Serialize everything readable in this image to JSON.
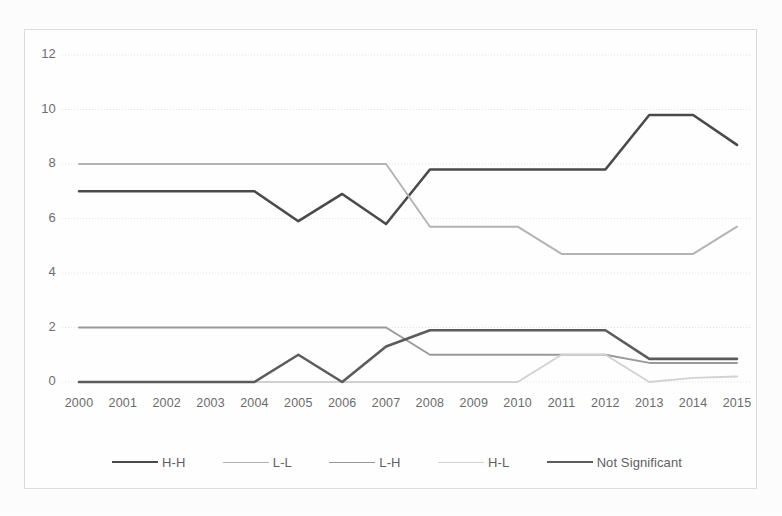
{
  "chart_data": {
    "type": "line",
    "title": "",
    "xlabel": "",
    "ylabel": "",
    "categories": [
      "2000",
      "2001",
      "2002",
      "2003",
      "2004",
      "2005",
      "2006",
      "2007",
      "2008",
      "2009",
      "2010",
      "2011",
      "2012",
      "2013",
      "2014",
      "2015"
    ],
    "ylim": [
      0,
      12
    ],
    "yticks": [
      0,
      2,
      4,
      6,
      8,
      10,
      12
    ],
    "ytick_labels": [
      "0",
      "2",
      "4",
      "6",
      "8",
      "10",
      "12"
    ],
    "grid": true,
    "legend_position": "bottom",
    "series": [
      {
        "name": "H-H",
        "color": "#4a4a4a",
        "width": 2.6,
        "values": [
          7,
          7,
          7,
          7,
          7,
          5.9,
          6.9,
          5.8,
          7.8,
          7.8,
          7.8,
          7.8,
          7.8,
          9.8,
          9.8,
          8.7
        ]
      },
      {
        "name": "L-L",
        "color": "#b4b4b4",
        "width": 1.9,
        "values": [
          8,
          8,
          8,
          8,
          8,
          8,
          8,
          8,
          5.7,
          5.7,
          5.7,
          4.7,
          4.7,
          4.7,
          4.7,
          5.7
        ]
      },
      {
        "name": "L-H",
        "color": "#9a9a9a",
        "width": 1.9,
        "values": [
          2,
          2,
          2,
          2,
          2,
          2,
          2,
          2,
          1,
          1,
          1,
          1,
          1,
          0.7,
          0.7,
          0.7
        ]
      },
      {
        "name": "H-L",
        "color": "#d2d2d2",
        "width": 1.9,
        "values": [
          0,
          0,
          0,
          0,
          0,
          0,
          0,
          0,
          0,
          0,
          0,
          1,
          1,
          0,
          0.15,
          0.2
        ]
      },
      {
        "name": "Not Significant",
        "color": "#5c5c5c",
        "width": 2.6,
        "values": [
          0,
          0,
          0,
          0,
          0,
          1,
          0,
          1.3,
          1.9,
          1.9,
          1.9,
          1.9,
          1.9,
          0.85,
          0.85,
          0.85
        ]
      }
    ]
  },
  "legend": {
    "items": [
      {
        "label": "H-H"
      },
      {
        "label": "L-L"
      },
      {
        "label": "L-H"
      },
      {
        "label": "H-L"
      },
      {
        "label": "Not Significant"
      }
    ]
  }
}
